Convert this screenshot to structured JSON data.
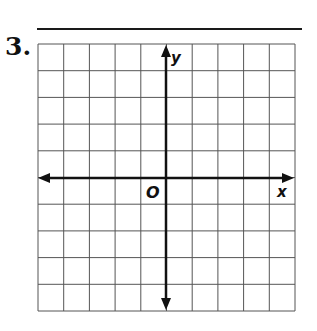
{
  "problem": {
    "number": "3."
  },
  "graph": {
    "type": "coordinate-plane",
    "columns": 10,
    "rows": 10,
    "x_axis_label": "x",
    "y_axis_label": "y",
    "origin_label": "O",
    "grid_color": "#555555",
    "axis_color": "#111111"
  }
}
